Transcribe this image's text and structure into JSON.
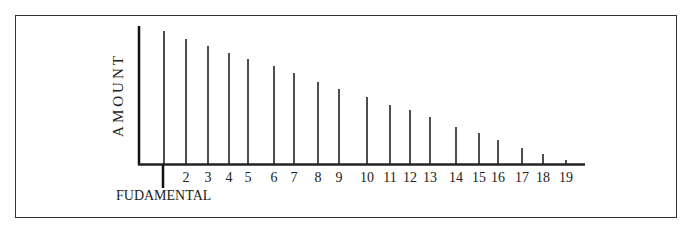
{
  "chart_data": {
    "type": "bar",
    "title": "",
    "ylabel": "AMOUNT",
    "xlabel": "",
    "fundamental_label": "FUDAMENTAL",
    "categories": [
      "1",
      "2",
      "3",
      "4",
      "5",
      "6",
      "7",
      "8",
      "9",
      "10",
      "11",
      "12",
      "13",
      "14",
      "15",
      "16",
      "17",
      "18",
      "19"
    ],
    "tick_labels": [
      "",
      "2",
      "3",
      "4",
      "5",
      "6",
      "7",
      "8",
      "9",
      "10",
      "11",
      "12",
      "13",
      "14",
      "15",
      "16",
      "17",
      "18",
      "19"
    ],
    "values": [
      100,
      94,
      89,
      83,
      79,
      71,
      66,
      59,
      54,
      49,
      43,
      39,
      34,
      27,
      22,
      17,
      12,
      7,
      3
    ],
    "x_px": [
      164,
      186,
      208,
      229,
      248,
      274,
      294,
      318,
      339,
      367,
      390,
      410,
      430,
      456,
      479,
      498,
      522,
      543,
      566
    ],
    "top_px": [
      31,
      39,
      46,
      53,
      59,
      66,
      73,
      82,
      89,
      97,
      105,
      110,
      117,
      127,
      133,
      140,
      148,
      154,
      160
    ],
    "baseline_px": 164,
    "grid": false,
    "legend": "none"
  }
}
